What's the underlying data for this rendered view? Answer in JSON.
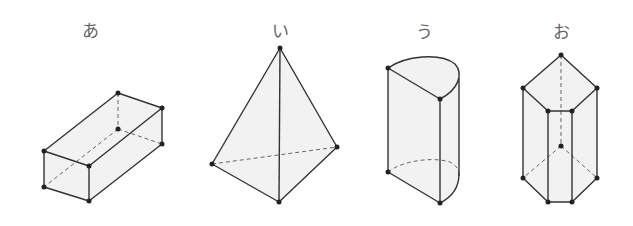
{
  "figure": {
    "type": "solid-shapes",
    "colors": {
      "edge": "#333333",
      "hidden_edge": "#666666",
      "face": "#f2f2f2",
      "vertex": "#222222",
      "label": "#666666"
    },
    "shapes": [
      {
        "id": "a",
        "label": "あ",
        "kind": "rectangular-prism"
      },
      {
        "id": "i",
        "label": "い",
        "kind": "triangular-pyramid"
      },
      {
        "id": "u",
        "label": "う",
        "kind": "half-cylinder"
      },
      {
        "id": "o",
        "label": "お",
        "kind": "pentagonal-prism"
      }
    ]
  }
}
